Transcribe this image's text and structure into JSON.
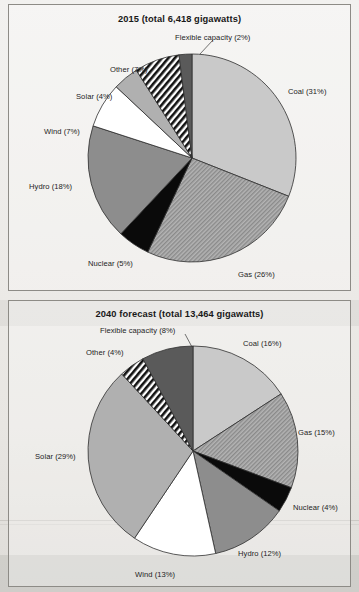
{
  "document": {
    "kind": "scanned-book-figure",
    "background_color": "#eceae7",
    "frame_border_color": "#8d8b86"
  },
  "chart_data": [
    {
      "type": "pie",
      "id": "chart-2015",
      "title": "2015 (total 6,418 gigawatts)",
      "year": "2015",
      "total_label": "total 6,418 gigawatts",
      "total_gigawatts": 6418,
      "start_angle_deg": 0,
      "direction": "clockwise",
      "legend": "labels-outside",
      "categories": [
        "Coal",
        "Gas",
        "Nuclear",
        "Hydro",
        "Wind",
        "Solar",
        "Other",
        "Flexible capacity"
      ],
      "values": [
        31,
        26,
        5,
        18,
        7,
        4,
        7,
        2
      ],
      "labels": [
        "Coal (31%)",
        "Gas (26%)",
        "Nuclear (5%)",
        "Hydro (18%)",
        "Wind (7%)",
        "Solar (4%)",
        "Other (7%)",
        "Flexible capacity (2%)"
      ],
      "slice_styles": [
        "light-gray",
        "diagonal-hatch-gray",
        "black",
        "mid-gray",
        "white",
        "light-mid-gray",
        "diagonal-stripes-black-white",
        "dark-gray"
      ],
      "colors": {
        "coal": "#c9c9c9",
        "gas": "#9a9a9a",
        "nuclear": "#0a0a0a",
        "hydro": "#8d8d8d",
        "wind": "#ffffff",
        "solar": "#b0b0b0",
        "other": "#1c1c1c",
        "flexible_capacity": "#5a5a5a"
      }
    },
    {
      "type": "pie",
      "id": "chart-2040",
      "title": "2040 forecast (total 13,464 gigawatts)",
      "year": "2040",
      "total_label": "total 13,464 gigawatts",
      "total_gigawatts": 13464,
      "start_angle_deg": 0,
      "direction": "clockwise",
      "legend": "labels-outside",
      "categories": [
        "Coal",
        "Gas",
        "Nuclear",
        "Hydro",
        "Wind",
        "Solar",
        "Other",
        "Flexible capacity"
      ],
      "values": [
        16,
        15,
        4,
        12,
        13,
        29,
        4,
        8
      ],
      "labels": [
        "Coal (16%)",
        "Gas (15%)",
        "Nuclear (4%)",
        "Hydro (12%)",
        "Wind (13%)",
        "Solar (29%)",
        "Other (4%)",
        "Flexible capacity (8%)"
      ],
      "slice_styles": [
        "light-gray",
        "diagonal-hatch-gray",
        "black",
        "mid-gray",
        "white",
        "light-mid-gray",
        "diagonal-stripes-black-white",
        "dark-gray"
      ],
      "colors": {
        "coal": "#c9c9c9",
        "gas": "#9a9a9a",
        "nuclear": "#0a0a0a",
        "hydro": "#8d8d8d",
        "wind": "#ffffff",
        "solar": "#b0b0b0",
        "other": "#1c1c1c",
        "flexible_capacity": "#5a5a5a"
      }
    }
  ]
}
